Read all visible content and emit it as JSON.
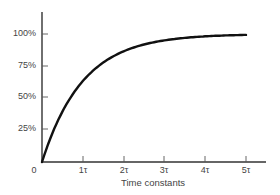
{
  "chart_data": {
    "type": "line",
    "title": "",
    "xlabel": "Time constants",
    "ylabel": "",
    "x_ticks": [
      "0",
      "1τ",
      "2τ",
      "3τ",
      "4τ",
      "5τ"
    ],
    "y_ticks": [
      "25%",
      "50%",
      "75%",
      "100%"
    ],
    "xlim": [
      0,
      5.4
    ],
    "ylim": [
      0,
      1.25
    ],
    "grid": false,
    "legend": "none",
    "series": [
      {
        "name": "Charge (1 - e^(-t/τ))",
        "x": [
          0,
          0.5,
          1,
          1.5,
          2,
          2.5,
          3,
          3.5,
          4,
          4.5,
          5
        ],
        "values": [
          0,
          39.3,
          63.2,
          77.7,
          86.5,
          91.8,
          95.0,
          97.0,
          98.2,
          98.9,
          99.3
        ]
      }
    ]
  },
  "labels": {
    "origin": "0",
    "y": {
      "t25": "25%",
      "t50": "50%",
      "t75": "75%",
      "t100": "100%"
    },
    "x": {
      "t1": "1τ",
      "t2": "2τ",
      "t3": "3τ",
      "t4": "4τ",
      "t5": "5τ"
    },
    "xtitle": "Time constants"
  },
  "colors": {
    "axis": "#333333",
    "curve": "#111111"
  }
}
